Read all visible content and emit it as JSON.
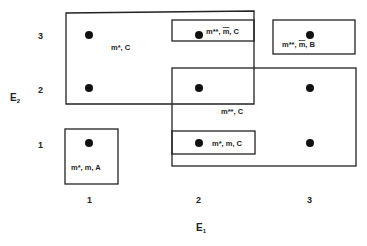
{
  "diagram": {
    "axes": {
      "x_label": "E",
      "x_subscript": "1",
      "y_label": "E",
      "y_subscript": "2",
      "x_ticks": [
        "1",
        "2",
        "3"
      ],
      "y_ticks": [
        "1",
        "2",
        "3"
      ]
    },
    "points": [
      {
        "e1": 1,
        "e2": 3
      },
      {
        "e1": 1,
        "e2": 2
      },
      {
        "e1": 2,
        "e2": 3
      },
      {
        "e1": 3,
        "e2": 3
      },
      {
        "e1": 2,
        "e2": 2
      },
      {
        "e1": 3,
        "e2": 2
      },
      {
        "e1": 1,
        "e2": 1
      },
      {
        "e1": 2,
        "e2": 1
      },
      {
        "e1": 3,
        "e2": 1
      }
    ],
    "regions": [
      {
        "id": "region-m-star-c",
        "label": "m*, C"
      },
      {
        "id": "region-m-2star-mbar-c",
        "label_pre": "m**, ",
        "label_bar": "m",
        "label_post": ", C"
      },
      {
        "id": "region-m-2star-mbar-b",
        "label_pre": "m**, ",
        "label_bar": "m",
        "label_post": ", B"
      },
      {
        "id": "region-m-2star-c",
        "label": "m**, C"
      },
      {
        "id": "region-m-star-m-c",
        "label": "m*, m, C"
      },
      {
        "id": "region-m-star-m-a",
        "label": "m*, m, A"
      }
    ]
  }
}
